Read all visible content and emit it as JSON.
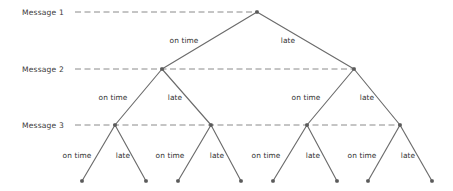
{
  "figure": {
    "type": "decision-tree-diagram",
    "width": 453,
    "height": 191,
    "background_color": "#ffffff",
    "line_color": "#6b6b6b",
    "node_color": "#5a5a5a",
    "dash_color": "#8a8a8a",
    "text_color": "#2f2f2f"
  },
  "levels": [
    {
      "label": "Message 1",
      "y": 12,
      "label_x": 22,
      "dash_start": 75,
      "dash_end": 257
    },
    {
      "label": "Message 2",
      "y": 69,
      "label_x": 22,
      "dash_start": 75,
      "dash_end": 354
    },
    {
      "label": "Message 3",
      "y": 125,
      "label_x": 22,
      "dash_start": 75,
      "dash_end": 400
    }
  ],
  "nodes": [
    {
      "id": "root",
      "x": 257,
      "y": 12,
      "level": 0
    },
    {
      "id": "n1",
      "x": 162,
      "y": 69,
      "level": 1
    },
    {
      "id": "n2",
      "x": 354,
      "y": 69,
      "level": 1
    },
    {
      "id": "n11",
      "x": 115,
      "y": 125,
      "level": 2
    },
    {
      "id": "n12",
      "x": 211,
      "y": 125,
      "level": 2
    },
    {
      "id": "n21",
      "x": 307,
      "y": 125,
      "level": 2
    },
    {
      "id": "n22",
      "x": 400,
      "y": 125,
      "level": 2
    },
    {
      "id": "l1",
      "x": 82,
      "y": 181,
      "level": 3
    },
    {
      "id": "l2",
      "x": 146,
      "y": 181,
      "level": 3
    },
    {
      "id": "l3",
      "x": 178,
      "y": 181,
      "level": 3
    },
    {
      "id": "l4",
      "x": 241,
      "y": 181,
      "level": 3
    },
    {
      "id": "l5",
      "x": 273,
      "y": 181,
      "level": 3
    },
    {
      "id": "l6",
      "x": 337,
      "y": 181,
      "level": 3
    },
    {
      "id": "l7",
      "x": 368,
      "y": 181,
      "level": 3
    },
    {
      "id": "l8",
      "x": 432,
      "y": 181,
      "level": 3
    }
  ],
  "edges": [
    {
      "from": "root",
      "to": "n1",
      "label": "on time",
      "label_x": 184,
      "label_y": 40
    },
    {
      "from": "root",
      "to": "n2",
      "label": "late",
      "label_x": 288,
      "label_y": 40
    },
    {
      "from": "n1",
      "to": "n11",
      "label": "on time",
      "label_x": 113,
      "label_y": 97
    },
    {
      "from": "n1",
      "to": "n12",
      "label": "late",
      "label_x": 175,
      "label_y": 97
    },
    {
      "from": "n2",
      "to": "n21",
      "label": "on time",
      "label_x": 306,
      "label_y": 97
    },
    {
      "from": "n2",
      "to": "n22",
      "label": "late",
      "label_x": 367,
      "label_y": 97
    },
    {
      "from": "n11",
      "to": "l1",
      "label": "on time",
      "label_x": 77,
      "label_y": 155
    },
    {
      "from": "n11",
      "to": "l2",
      "label": "late",
      "label_x": 123,
      "label_y": 155
    },
    {
      "from": "n12",
      "to": "l3",
      "label": "on time",
      "label_x": 170,
      "label_y": 155
    },
    {
      "from": "n12",
      "to": "l4",
      "label": "late",
      "label_x": 217,
      "label_y": 155
    },
    {
      "from": "n21",
      "to": "l5",
      "label": "on time",
      "label_x": 266,
      "label_y": 155
    },
    {
      "from": "n21",
      "to": "l6",
      "label": "late",
      "label_x": 313,
      "label_y": 155
    },
    {
      "from": "n22",
      "to": "l7",
      "label": "on time",
      "label_x": 362,
      "label_y": 155
    },
    {
      "from": "n22",
      "to": "l8",
      "label": "late",
      "label_x": 408,
      "label_y": 155
    }
  ]
}
